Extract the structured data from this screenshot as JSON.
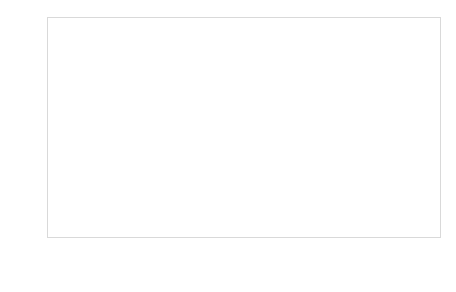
{
  "chart_data": {
    "type": "bar",
    "subtype": "100% stacked bar",
    "title": "",
    "subtitle": "",
    "xlabel": "",
    "ylabel": "",
    "ylim": [
      0,
      100
    ],
    "y_tick_labels": [
      "100%",
      "90%",
      "80%",
      "70%",
      "60%",
      "50%",
      "40%",
      "30%",
      "20%",
      "10%",
      "0%"
    ],
    "y_tick_values": [
      100,
      90,
      80,
      70,
      60,
      50,
      40,
      30,
      20,
      10,
      0
    ],
    "grid": true,
    "grid_axis": "y",
    "legend_position": "bottom",
    "categories": [
      "Dissatisfied 1_2_3",
      "4",
      "5",
      "6",
      "7",
      "Total Satisfied 8_9_10"
    ],
    "category_lines": [
      [
        "Dissatisfied",
        "1_2_3"
      ],
      [
        "4",
        ""
      ],
      [
        "5",
        ""
      ],
      [
        "6",
        ""
      ],
      [
        "7",
        ""
      ],
      [
        "Total Satisfied",
        "8_9_10"
      ]
    ],
    "series": [
      {
        "name": "Frequently_Sometimes",
        "color": "#595959",
        "stack_position": "bottom",
        "values": [
          62.0,
          57.4,
          52.7,
          51.66,
          34.51,
          18.73
        ],
        "labels": [
          "62%",
          "57,40%",
          "52,70%",
          "51,66%",
          "34,51%",
          "18,73%"
        ]
      },
      {
        "name": "Hardly ever",
        "color": "#a6a6a6",
        "stack_position": "top",
        "values": [
          38.42,
          42.6,
          47.3,
          48.34,
          65.49,
          81.37
        ],
        "labels": [
          "38,42%",
          "42,60%",
          "47,30%",
          "48,34%",
          "65,49%",
          "81,37%"
        ]
      }
    ]
  },
  "legend": {
    "items": [
      {
        "label": "Frequently_Sometimes",
        "color": "#595959"
      },
      {
        "label": "Hardly ever",
        "color": "#a6a6a6"
      }
    ]
  },
  "colors": {
    "series_dark": "#595959",
    "series_light": "#a6a6a6",
    "gridline": "#d9d9d9",
    "plot_border": "#d9d9d9",
    "text": "#3a3a3a",
    "label_on_dark": "#ffffff",
    "label_on_light": "#262626",
    "background": "#ffffff"
  }
}
